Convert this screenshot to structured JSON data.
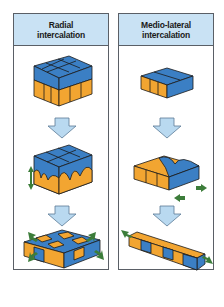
{
  "panels": [
    {
      "title_line1": "Radial",
      "title_line2": "intercalation"
    },
    {
      "title_line1": "Medio-lateral",
      "title_line2": "intercalation"
    }
  ],
  "colors": {
    "header_bg": "#c9e2f4",
    "border": "#5a5f66",
    "cell_blue": "#3b7fc4",
    "cell_orange": "#f2a531",
    "arrow_fill": "#b9d9f0",
    "green_arrow": "#3c7d3a"
  }
}
